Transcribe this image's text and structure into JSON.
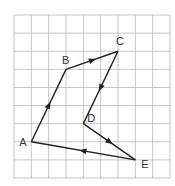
{
  "diagram": {
    "grid": {
      "cols": 9,
      "rows": 9,
      "line_color": "#b8b8b8"
    },
    "points": [
      {
        "id": "A",
        "label": "A",
        "col": 1,
        "row": 7
      },
      {
        "id": "B",
        "label": "B",
        "col": 3,
        "row": 3
      },
      {
        "id": "C",
        "label": "C",
        "col": 6,
        "row": 2
      },
      {
        "id": "D",
        "label": "D",
        "col": 4,
        "row": 6
      },
      {
        "id": "E",
        "label": "E",
        "col": 7,
        "row": 8
      }
    ],
    "edges": [
      {
        "from": "A",
        "to": "B",
        "arrow": true
      },
      {
        "from": "B",
        "to": "C",
        "arrow": true
      },
      {
        "from": "C",
        "to": "D",
        "arrow": true
      },
      {
        "from": "D",
        "to": "E",
        "arrow": true
      },
      {
        "from": "E",
        "to": "A",
        "arrow": true
      }
    ],
    "line_color": "#222222"
  }
}
